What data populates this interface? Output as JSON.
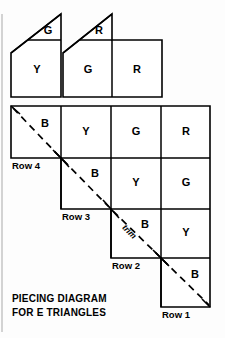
{
  "figure": {
    "caption_line1": "PIECING DIAGRAM",
    "caption_line2": "FOR E TRIANGLES",
    "trim_label": "trim"
  },
  "top_units": [
    {
      "name": "unit-left",
      "triangle_label": "G",
      "square_label": "Y"
    },
    {
      "name": "unit-right",
      "triangle_label": "R",
      "square_label": "G",
      "extra_square_label": "R"
    }
  ],
  "staircase": {
    "rows": [
      {
        "row_label": "Row 4",
        "cells": [
          "B",
          "Y",
          "G",
          "R"
        ]
      },
      {
        "row_label": "Row 3",
        "cells": [
          "B",
          "Y",
          "G"
        ]
      },
      {
        "row_label": "Row 2",
        "cells": [
          "B",
          "Y"
        ]
      },
      {
        "row_label": "Row 1",
        "cells": [
          "B"
        ]
      }
    ]
  },
  "colors": {
    "ink": "#000000",
    "paper": "#fdfdfd",
    "edge_rule": "#b8b8b8"
  }
}
